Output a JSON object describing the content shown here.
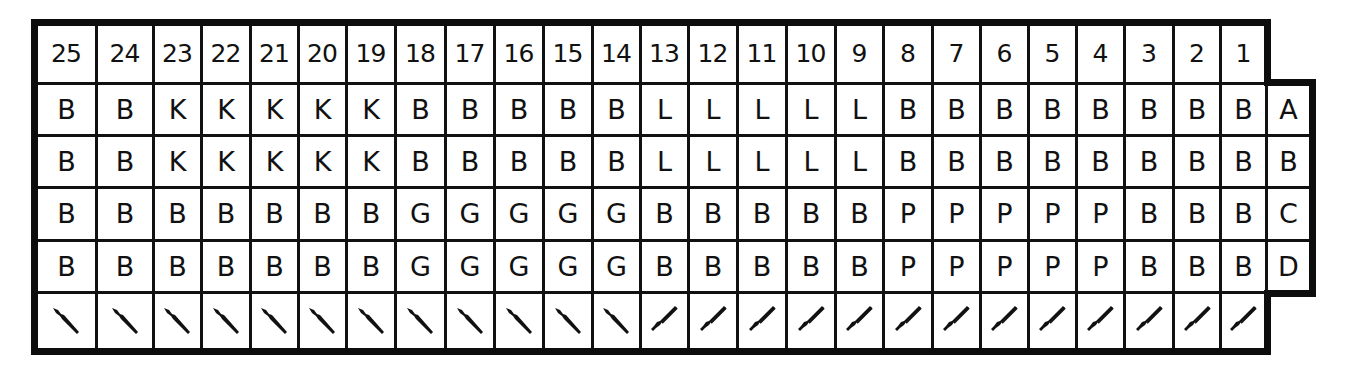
{
  "diagram": {
    "type": "connector-pin-color-chart",
    "columns": [
      "25",
      "24",
      "23",
      "22",
      "21",
      "20",
      "19",
      "18",
      "17",
      "16",
      "15",
      "14",
      "13",
      "12",
      "11",
      "10",
      "9",
      "8",
      "7",
      "6",
      "5",
      "4",
      "3",
      "2",
      "1"
    ],
    "row_labels": [
      "A",
      "B",
      "C",
      "D"
    ],
    "rows": [
      [
        "B",
        "B",
        "K",
        "K",
        "K",
        "K",
        "K",
        "B",
        "B",
        "B",
        "B",
        "B",
        "L",
        "L",
        "L",
        "L",
        "L",
        "B",
        "B",
        "B",
        "B",
        "B",
        "B",
        "B",
        "B"
      ],
      [
        "B",
        "B",
        "K",
        "K",
        "K",
        "K",
        "K",
        "B",
        "B",
        "B",
        "B",
        "B",
        "L",
        "L",
        "L",
        "L",
        "L",
        "B",
        "B",
        "B",
        "B",
        "B",
        "B",
        "B",
        "B"
      ],
      [
        "B",
        "B",
        "B",
        "B",
        "B",
        "B",
        "B",
        "G",
        "G",
        "G",
        "G",
        "G",
        "B",
        "B",
        "B",
        "B",
        "B",
        "P",
        "P",
        "P",
        "P",
        "P",
        "B",
        "B",
        "B"
      ],
      [
        "B",
        "B",
        "B",
        "B",
        "B",
        "B",
        "B",
        "G",
        "G",
        "G",
        "G",
        "G",
        "B",
        "B",
        "B",
        "B",
        "B",
        "P",
        "P",
        "P",
        "P",
        "P",
        "B",
        "B",
        "B"
      ]
    ],
    "terminal_row": {
      "icon_names": [
        "terminal-pin-left-icon",
        "terminal-pin-right-icon"
      ],
      "orientation": [
        "left",
        "left",
        "left",
        "left",
        "left",
        "left",
        "left",
        "left",
        "left",
        "left",
        "left",
        "left",
        "right",
        "right",
        "right",
        "right",
        "right",
        "right",
        "right",
        "right",
        "right",
        "right",
        "right",
        "right",
        "right"
      ]
    },
    "colors": {
      "line": "#111111",
      "background": "#ffffff"
    }
  }
}
